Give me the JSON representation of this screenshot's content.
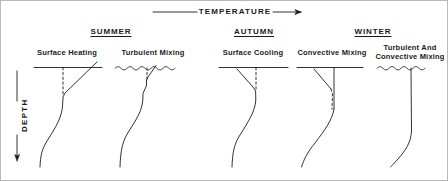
{
  "figure": {
    "width": 448,
    "height": 181,
    "background": "#ffffff",
    "line_color": "#1b1b1b",
    "border_color": "#b9b9b9"
  },
  "axes": {
    "x_axis": {
      "label": "TEMPERATURE",
      "direction": "right",
      "arrow": "right-arrow-icon",
      "position": "top"
    },
    "y_axis": {
      "label": "DEPTH",
      "direction": "down",
      "arrow": "down-arrow-icon",
      "position": "left"
    }
  },
  "seasons": [
    {
      "key": "summer",
      "label": "SUMMER",
      "center_x": 110
    },
    {
      "key": "autumn",
      "label": "AUTUMN",
      "center_x": 253
    },
    {
      "key": "winter",
      "label": "WINTER",
      "center_x": 372
    }
  ],
  "panels": [
    {
      "key": "surface-heating",
      "label": "Surface Heating",
      "label_line2": "",
      "season": "summer",
      "center_x": 66,
      "surface_line": "straight",
      "profile_style": "solid",
      "reference_line": "dashed-vertical",
      "notes": "Warm surface layer, temperature increases toward surface"
    },
    {
      "key": "turbulent-mixing-summer",
      "label": "Turbulent Mixing",
      "label_line2": "",
      "season": "summer",
      "center_x": 152,
      "surface_line": "wavy",
      "profile_style": "solid",
      "reference_line": "dashed-vertical",
      "notes": "Wind driven mixing creates a shallow isothermal mixed layer"
    },
    {
      "key": "surface-cooling",
      "label": "Surface Cooling",
      "label_line2": "",
      "season": "autumn",
      "center_x": 252,
      "surface_line": "straight",
      "profile_style": "solid",
      "reference_line": "dashed-vertical",
      "notes": "Surface loses heat, profile bends toward colder temperature"
    },
    {
      "key": "convective-mixing",
      "label": "Convective Mixing",
      "label_line2": "",
      "season": "winter",
      "center_x": 331,
      "surface_line": "straight",
      "profile_style": "solid",
      "reference_line": "dashed-vertical",
      "notes": "Density driven overturning deepens the isothermal layer"
    },
    {
      "key": "turbulent-and-convective-mixing",
      "label": "Turbulent And",
      "label_line2": "Convective Mixing",
      "season": "winter",
      "center_x": 409,
      "surface_line": "wavy",
      "profile_style": "solid",
      "reference_line": "none",
      "notes": "Deep uniform mixed layer extends through the whole profile"
    }
  ]
}
